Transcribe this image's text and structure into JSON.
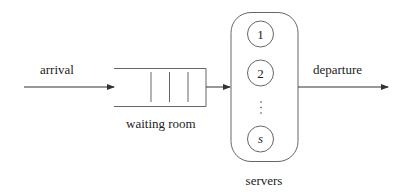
{
  "diagram": {
    "type": "queueing-system",
    "colors": {
      "line": "#555555",
      "text": "#222222",
      "background": "#ffffff"
    },
    "labels": {
      "arrival": "arrival",
      "waiting_room": "waiting room",
      "departure": "departure",
      "servers": "servers"
    },
    "servers": [
      {
        "label": "1"
      },
      {
        "label": "2"
      },
      {
        "label": "s"
      }
    ],
    "ellipsis": "⋮",
    "queue_slots": 3
  }
}
